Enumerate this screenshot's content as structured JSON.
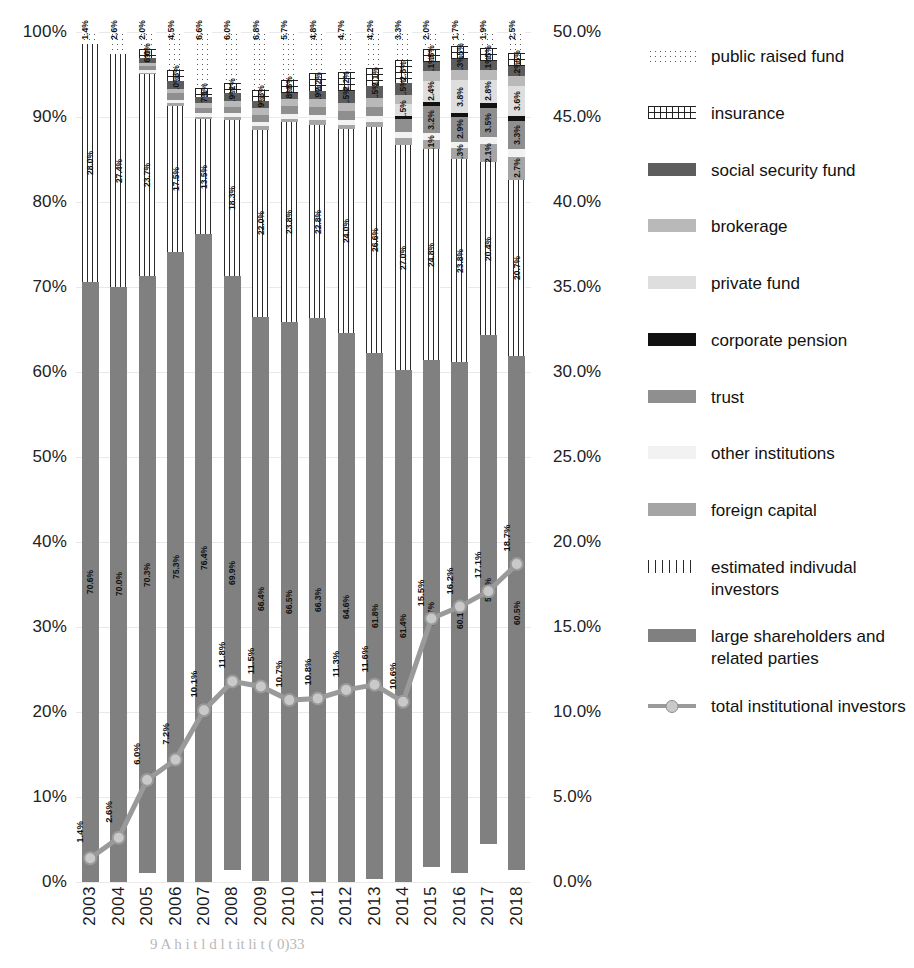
{
  "chart_data": {
    "type": "bar",
    "stacked": true,
    "title": "",
    "xlabel": "",
    "ylabel": "",
    "categories": [
      "2003",
      "2004",
      "2005",
      "2006",
      "2007",
      "2008",
      "2009",
      "2010",
      "2011",
      "2012",
      "2013",
      "2014",
      "2015",
      "2016",
      "2017",
      "2018"
    ],
    "left_axis": {
      "label": "",
      "ticks": [
        "0%",
        "10%",
        "20%",
        "30%",
        "40%",
        "50%",
        "60%",
        "70%",
        "80%",
        "90%",
        "100%"
      ],
      "ylim": [
        0,
        100
      ]
    },
    "right_axis": {
      "label": "",
      "ticks": [
        "0.0%",
        "5.0%",
        "10.0%",
        "15.0%",
        "20.0%",
        "25.0%",
        "30.0%",
        "35.0%",
        "40.0%",
        "45.0%",
        "50.0%"
      ],
      "ylim": [
        0,
        50
      ]
    },
    "grid": true,
    "legend_position": "right",
    "series": [
      {
        "name": "public raised fund",
        "key": "public",
        "color": "#ffffff",
        "pattern": "dots",
        "values": [
          1.4,
          2.6,
          2.0,
          4.5,
          6.6,
          6.0,
          6.8,
          5.7,
          4.8,
          4.7,
          4.2,
          3.3,
          2.0,
          1.7,
          1.9,
          2.5
        ],
        "labels": [
          "1.4%",
          "2.6%",
          "2.0%",
          "4.5%",
          "6.6%",
          "6.0%",
          "6.8%",
          "5.7%",
          "4.8%",
          "4.7%",
          "4.2%",
          "3.3%",
          "2.0%",
          "1.7%",
          "1.9%",
          "2.5%"
        ]
      },
      {
        "name": "insurance",
        "key": "insurance",
        "color": "#ffffff",
        "pattern": "grid",
        "values": [
          0.0,
          0.0,
          1.0,
          1.3,
          1.1,
          1.2,
          1.3,
          1.5,
          2.2,
          2.2,
          2.1,
          2.8,
          1.5,
          1.5,
          1.5,
          1.5
        ],
        "labels": [
          "",
          "",
          "1.0%",
          "1.3%",
          "1.1%",
          "1.2%",
          "1.3%",
          "1.5%",
          "2.2%",
          "2.2%",
          "2.1%",
          "2.8%",
          "1.5%",
          "1.5%",
          "1.5%",
          "1.5%"
        ]
      },
      {
        "name": "social security fund",
        "key": "ssf",
        "color": "#5d5d5d",
        "pattern": "solid",
        "values": [
          0.0,
          0.0,
          0.6,
          1.0,
          0.7,
          0.9,
          0.9,
          0.8,
          0.9,
          1.5,
          1.5,
          1.5,
          1.1,
          1.3,
          1.1,
          1.2
        ],
        "labels": [
          "",
          "",
          "0.6%",
          "1.0%",
          "0.7%",
          "0.9%",
          "0.9%",
          "0.8%",
          "0.9%",
          "1.5%",
          "1.5%",
          "1.5%",
          "1.1%",
          "1.3%",
          "1.1%",
          "1.2%"
        ]
      },
      {
        "name": "brokerage",
        "key": "brokerage",
        "color": "#b9b9b9",
        "pattern": "solid",
        "values": [
          0.0,
          0.0,
          0.4,
          0.5,
          0.6,
          0.7,
          0.8,
          0.8,
          0.9,
          0.9,
          1.0,
          1.0,
          1.2,
          1.2,
          1.1,
          1.1
        ],
        "labels": [
          "",
          "",
          "",
          "",
          "",
          "",
          "",
          "",
          "",
          "",
          "",
          "",
          "",
          "",
          "",
          ""
        ]
      },
      {
        "name": "private fund",
        "key": "private",
        "color": "#dedede",
        "pattern": "solid",
        "values": [
          0.0,
          0.0,
          0.0,
          0.0,
          0.0,
          0.0,
          0.0,
          0.0,
          0.0,
          0.0,
          0.0,
          1.5,
          2.4,
          3.8,
          2.8,
          3.6
        ],
        "labels": [
          "",
          "",
          "",
          "",
          "",
          "",
          "",
          "",
          "",
          "",
          "",
          "1.5%",
          "2.4%",
          "3.8%",
          "2.8%",
          "3.6%"
        ]
      },
      {
        "name": "corporate pension",
        "key": "pension",
        "color": "#111111",
        "pattern": "solid",
        "values": [
          0.0,
          0.0,
          0.0,
          0.0,
          0.0,
          0.0,
          0.0,
          0.0,
          0.0,
          0.0,
          0.0,
          0.4,
          0.5,
          0.5,
          0.5,
          0.6
        ],
        "labels": [
          "",
          "",
          "",
          "",
          "",
          "",
          "",
          "",
          "",
          "",
          "",
          "",
          "",
          "",
          "",
          ""
        ]
      },
      {
        "name": "trust",
        "key": "trust",
        "color": "#8f8f8f",
        "pattern": "solid",
        "values": [
          0.0,
          0.0,
          0.5,
          0.8,
          0.6,
          0.7,
          0.8,
          0.9,
          1.0,
          1.0,
          1.1,
          1.5,
          3.2,
          2.9,
          3.5,
          3.3
        ],
        "labels": [
          "",
          "",
          "",
          "",
          "",
          "",
          "",
          "",
          "",
          "",
          "",
          "",
          "3.2%",
          "2.9%",
          "3.5%",
          "3.3%"
        ]
      },
      {
        "name": "other institutions",
        "key": "other",
        "color": "#f2f2f2",
        "pattern": "solid",
        "values": [
          0.0,
          0.0,
          0.3,
          0.4,
          0.4,
          0.5,
          0.5,
          0.6,
          0.6,
          0.6,
          0.7,
          0.7,
          0.8,
          0.8,
          0.8,
          0.9
        ],
        "labels": [
          "",
          "",
          "",
          "",
          "",
          "",
          "",
          "",
          "",
          "",
          "",
          "",
          "",
          "",
          "",
          ""
        ]
      },
      {
        "name": "foreign capital",
        "key": "foreign",
        "color": "#a5a5a5",
        "pattern": "solid",
        "values": [
          0.0,
          0.0,
          0.2,
          0.3,
          0.3,
          0.4,
          0.4,
          0.4,
          0.5,
          0.5,
          0.6,
          0.9,
          1.1,
          1.3,
          2.1,
          2.7
        ],
        "labels": [
          "",
          "",
          "",
          "",
          "",
          "",
          "",
          "",
          "",
          "",
          "",
          "",
          "1.1%",
          "1.3%",
          "2.1%",
          "2.7%"
        ]
      },
      {
        "name": "estimated indivudal investors",
        "key": "individual",
        "color": "#ffffff",
        "pattern": "vlines",
        "values": [
          28.0,
          27.4,
          23.7,
          17.5,
          13.5,
          18.3,
          22.0,
          23.8,
          22.8,
          24.0,
          26.6,
          27.0,
          24.8,
          23.8,
          20.4,
          20.7
        ],
        "labels": [
          "28.0%",
          "27.4%",
          "23.7%",
          "17.5%",
          "13.5%",
          "18.3%",
          "22.0%",
          "23.8%",
          "22.8%",
          "24.0%",
          "26.6%",
          "27.0%",
          "24.8%",
          "23.8%",
          "20.4%",
          "20.7%"
        ]
      },
      {
        "name": "large shareholders and related parties",
        "key": "large",
        "color": "#808080",
        "pattern": "solid",
        "values": [
          70.6,
          70.0,
          70.3,
          75.3,
          76.4,
          69.9,
          66.4,
          66.5,
          66.3,
          64.6,
          61.8,
          61.4,
          59.7,
          60.1,
          59.8,
          60.5
        ],
        "labels": [
          "70.6%",
          "70.0%",
          "70.3%",
          "75.3%",
          "76.4%",
          "69.9%",
          "66.4%",
          "66.5%",
          "66.3%",
          "64.6%",
          "61.8%",
          "61.4%",
          "59.7%",
          "60.1%",
          "59.8%",
          "60.5%"
        ]
      }
    ],
    "line_series": {
      "name": "total institutional investors",
      "color": "#9a9a9a",
      "marker_color": "#c9c9c9",
      "axis": "right",
      "values": [
        1.4,
        2.6,
        6.0,
        7.2,
        10.1,
        11.8,
        11.5,
        10.7,
        10.8,
        11.3,
        11.6,
        10.6,
        15.5,
        16.2,
        17.1,
        18.7
      ],
      "labels": [
        "1.4%",
        "2.6%",
        "6.0%",
        "7.2%",
        "10.1%",
        "11.8%",
        "11.5%",
        "10.7%",
        "10.8%",
        "11.3%",
        "11.6%",
        "10.6%",
        "15.5%",
        "16.2%",
        "17.1%",
        "18.7%"
      ]
    }
  },
  "legend": {
    "items": [
      {
        "label": "public raised fund",
        "swatch": "dots"
      },
      {
        "label": "insurance",
        "swatch": "grid"
      },
      {
        "label": "social security fund",
        "swatch": "ssf"
      },
      {
        "label": "brokerage",
        "swatch": "brokerage"
      },
      {
        "label": "private fund",
        "swatch": "private"
      },
      {
        "label": "corporate pension",
        "swatch": "pension"
      },
      {
        "label": "trust",
        "swatch": "trust"
      },
      {
        "label": "other institutions",
        "swatch": "other"
      },
      {
        "label": "foreign capital",
        "swatch": "foreign"
      },
      {
        "label": "estimated indivudal investors",
        "swatch": "indiv"
      },
      {
        "label": "large shareholders and related parties",
        "swatch": "large"
      },
      {
        "label": "total institutional investors",
        "swatch": "line"
      }
    ]
  },
  "caption": "9    A  h       i      t      l      d           l    t     it li   t     (       0)33"
}
